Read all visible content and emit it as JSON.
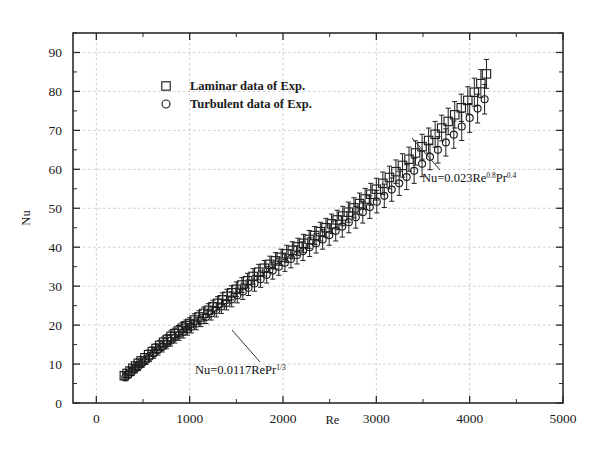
{
  "chart_data": {
    "type": "scatter",
    "title": "",
    "xlabel": "Re",
    "ylabel": "Nu",
    "xlim": [
      -250,
      5000
    ],
    "ylim": [
      0,
      95
    ],
    "xticks": [
      0,
      1000,
      2000,
      3000,
      4000,
      5000
    ],
    "xtick_labels": [
      "0",
      "1000",
      "2000",
      "3000",
      "4000",
      "5000"
    ],
    "xminor_step": 500,
    "yticks": [
      0,
      10,
      20,
      30,
      40,
      50,
      60,
      70,
      80,
      90
    ],
    "ytick_labels": [
      "0",
      "10",
      "20",
      "30",
      "40",
      "50",
      "60",
      "70",
      "80",
      "90"
    ],
    "yminor_step": 5,
    "grid": true,
    "grid_style": "dotted",
    "legend_position": "upper-left-inside",
    "series": [
      {
        "name": "Laminar data of Exp.",
        "marker": "open-square",
        "x": [
          300,
          330,
          360,
          390,
          420,
          450,
          480,
          520,
          560,
          600,
          640,
          680,
          720,
          760,
          800,
          840,
          880,
          920,
          960,
          1000,
          1050,
          1100,
          1150,
          1200,
          1250,
          1300,
          1350,
          1400,
          1450,
          1500,
          1560,
          1620,
          1680,
          1740,
          1800,
          1860,
          1920,
          1980,
          2040,
          2100,
          2160,
          2220,
          2280,
          2340,
          2400,
          2460,
          2520,
          2580,
          2640,
          2700,
          2760,
          2820,
          2880,
          2940,
          3000,
          3070,
          3140,
          3210,
          3280,
          3350,
          3420,
          3490,
          3560,
          3630,
          3700,
          3770,
          3840,
          3910,
          3980,
          4050,
          4120,
          4180
        ],
        "y": [
          7.0,
          7.6,
          8.2,
          8.9,
          9.5,
          10.2,
          10.8,
          11.6,
          12.4,
          13.2,
          14.0,
          14.8,
          15.6,
          16.3,
          17.1,
          17.8,
          18.5,
          19.2,
          19.8,
          20.4,
          21.3,
          22.1,
          23.0,
          23.8,
          24.7,
          25.6,
          26.5,
          27.4,
          28.3,
          29.2,
          30.3,
          31.4,
          32.5,
          33.6,
          34.6,
          35.6,
          36.5,
          37.4,
          38.3,
          39.2,
          40.1,
          41.0,
          42.0,
          43.0,
          44.0,
          45.0,
          46.0,
          47.0,
          48.0,
          49.0,
          50.1,
          51.2,
          52.4,
          53.6,
          54.9,
          56.4,
          57.9,
          59.4,
          61.0,
          62.6,
          64.2,
          65.8,
          67.4,
          69.0,
          70.6,
          72.3,
          74.0,
          75.8,
          77.7,
          79.8,
          82.0,
          84.5
        ],
        "yerr": [
          0.9,
          0.9,
          1.0,
          1.0,
          1.0,
          1.1,
          1.1,
          1.1,
          1.2,
          1.2,
          1.2,
          1.3,
          1.3,
          1.3,
          1.4,
          1.4,
          1.4,
          1.5,
          1.5,
          1.5,
          1.6,
          1.6,
          1.6,
          1.7,
          1.7,
          1.7,
          1.8,
          1.8,
          1.8,
          1.9,
          1.9,
          1.9,
          2.0,
          2.0,
          2.0,
          2.1,
          2.1,
          2.1,
          2.2,
          2.2,
          2.2,
          2.3,
          2.3,
          2.3,
          2.4,
          2.4,
          2.5,
          2.5,
          2.5,
          2.6,
          2.6,
          2.7,
          2.7,
          2.8,
          2.8,
          2.9,
          2.9,
          3.0,
          3.0,
          3.1,
          3.1,
          3.2,
          3.2,
          3.3,
          3.3,
          3.4,
          3.4,
          3.5,
          3.5,
          3.6,
          3.6,
          3.7
        ]
      },
      {
        "name": "Turbulent data of Exp.",
        "marker": "open-circle",
        "x": [
          310,
          345,
          380,
          415,
          450,
          490,
          530,
          570,
          615,
          660,
          705,
          750,
          795,
          840,
          885,
          930,
          975,
          1020,
          1070,
          1120,
          1175,
          1230,
          1285,
          1340,
          1395,
          1450,
          1510,
          1570,
          1630,
          1695,
          1760,
          1825,
          1890,
          1955,
          2020,
          2085,
          2150,
          2215,
          2285,
          2355,
          2425,
          2495,
          2565,
          2635,
          2705,
          2780,
          2855,
          2930,
          3005,
          3085,
          3165,
          3245,
          3325,
          3405,
          3490,
          3575,
          3660,
          3745,
          3830,
          3915,
          4000,
          4085,
          4160
        ],
        "y": [
          6.6,
          7.3,
          8.0,
          8.7,
          9.4,
          10.2,
          11.0,
          11.8,
          12.7,
          13.6,
          14.4,
          15.2,
          16.0,
          16.8,
          17.5,
          18.2,
          18.9,
          19.6,
          20.4,
          21.2,
          22.1,
          23.0,
          23.9,
          24.8,
          25.7,
          26.6,
          27.6,
          28.6,
          29.6,
          30.7,
          31.8,
          32.9,
          34.0,
          35.0,
          36.0,
          37.0,
          38.0,
          39.0,
          40.0,
          41.0,
          42.0,
          43.1,
          44.2,
          45.3,
          46.4,
          47.7,
          49.0,
          50.3,
          51.7,
          53.2,
          54.8,
          56.4,
          58.0,
          59.6,
          61.4,
          63.2,
          65.0,
          66.9,
          68.9,
          71.0,
          73.2,
          75.6,
          78.0
        ],
        "yerr": [
          0.9,
          0.9,
          1.0,
          1.0,
          1.1,
          1.1,
          1.1,
          1.2,
          1.2,
          1.3,
          1.3,
          1.3,
          1.4,
          1.4,
          1.4,
          1.5,
          1.5,
          1.6,
          1.6,
          1.6,
          1.7,
          1.7,
          1.8,
          1.8,
          1.8,
          1.9,
          1.9,
          2.0,
          2.0,
          2.0,
          2.1,
          2.1,
          2.2,
          2.2,
          2.2,
          2.3,
          2.3,
          2.4,
          2.4,
          2.5,
          2.5,
          2.6,
          2.6,
          2.7,
          2.7,
          2.8,
          2.8,
          2.9,
          2.9,
          3.0,
          3.0,
          3.1,
          3.2,
          3.2,
          3.3,
          3.3,
          3.4,
          3.5,
          3.5,
          3.6,
          3.7,
          3.7,
          3.8
        ]
      }
    ],
    "annotations": [
      {
        "id": "laminar-correlation",
        "text_plain": "Nu=0.0117RePr1/3",
        "base": "Nu=0.0117RePr",
        "sup": "1/3",
        "x_text": 195,
        "y_text": 374,
        "leader_from": [
          260,
          362
        ],
        "leader_to": [
          232,
          330
        ]
      },
      {
        "id": "turbulent-correlation",
        "text_plain": "Nu=0.023Re0.8Pr0.4",
        "base1": "Nu=0.023Re",
        "sup1": "0.8",
        "base2": "Pr",
        "sup2": "0.4",
        "x_text": 422,
        "y_text": 182,
        "leader_from": [
          440,
          170
        ],
        "leader_to": [
          412,
          138
        ]
      }
    ]
  },
  "legend": {
    "entries": [
      {
        "label": "Laminar data of Exp.",
        "marker": "open-square",
        "marker_icon": "square-marker-icon"
      },
      {
        "label": "Turbulent data of Exp.",
        "marker": "open-circle",
        "marker_icon": "circle-marker-icon"
      }
    ]
  },
  "colors": {
    "axis": "#2b2b2b",
    "grid": "#b9b9b9",
    "marker": "#1f1f1f",
    "background": "#ffffff",
    "text": "#1a1a1a"
  },
  "axes": {
    "x_title": "Re",
    "y_title": "Nu"
  }
}
